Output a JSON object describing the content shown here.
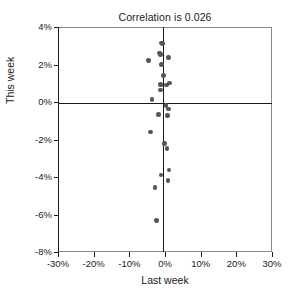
{
  "chart_data": {
    "type": "scatter",
    "title": "Correlation is 0.026",
    "xlabel": "Last week",
    "ylabel": "This week",
    "xlim": [
      -0.3,
      0.3
    ],
    "ylim": [
      -0.08,
      0.04
    ],
    "grid": false,
    "legend": null,
    "x_ticks": [
      -0.3,
      -0.2,
      -0.1,
      0.0,
      0.1,
      0.2,
      0.3
    ],
    "y_ticks": [
      0.04,
      0.02,
      0.0,
      -0.02,
      -0.04,
      -0.06,
      -0.08
    ],
    "x_tick_labels": [
      "-30%",
      "-20%",
      "-10%",
      "0%",
      "10%",
      "20%",
      "30%"
    ],
    "y_tick_labels": [
      "4%",
      "2%",
      "0%",
      "-2%",
      "-4%",
      "-6%",
      "-8%"
    ],
    "annotations": {
      "zero_line_horizontal": 0.0,
      "zero_line_vertical": 0.0
    },
    "marker_color": "#555555",
    "axis_color": "#1a1a1a",
    "frame_color": "#8a8a8a",
    "points": [
      {
        "x": -0.009,
        "y": 0.0315
      },
      {
        "x": -0.007,
        "y": 0.0312
      },
      {
        "x": -0.016,
        "y": 0.0262
      },
      {
        "x": -0.013,
        "y": 0.0252
      },
      {
        "x": -0.046,
        "y": 0.0222
      },
      {
        "x": 0.01,
        "y": 0.0238
      },
      {
        "x": -0.01,
        "y": 0.02
      },
      {
        "x": -0.004,
        "y": 0.014
      },
      {
        "x": 0.013,
        "y": 0.0102
      },
      {
        "x": -0.013,
        "y": 0.0093
      },
      {
        "x": -0.011,
        "y": 0.009
      },
      {
        "x": 0.004,
        "y": 0.009
      },
      {
        "x": -0.012,
        "y": 0.0063
      },
      {
        "x": -0.037,
        "y": 0.0012
      },
      {
        "x": 0.003,
        "y": -0.0018
      },
      {
        "x": 0.01,
        "y": -0.0037
      },
      {
        "x": -0.018,
        "y": -0.0066
      },
      {
        "x": 0.007,
        "y": -0.0072
      },
      {
        "x": -0.041,
        "y": -0.016
      },
      {
        "x": -0.002,
        "y": -0.0222
      },
      {
        "x": 0.006,
        "y": -0.0248
      },
      {
        "x": 0.011,
        "y": -0.0362
      },
      {
        "x": -0.011,
        "y": -0.039
      },
      {
        "x": 0.008,
        "y": -0.0418
      },
      {
        "x": -0.028,
        "y": -0.0455
      },
      {
        "x": -0.023,
        "y": -0.0633
      }
    ]
  }
}
